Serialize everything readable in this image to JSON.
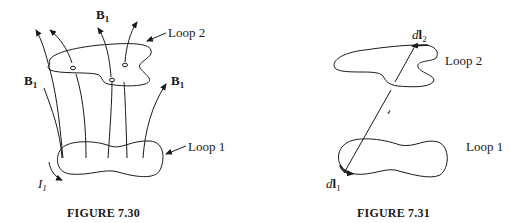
{
  "figures": [
    {
      "id": "fig-7-30",
      "caption": "FIGURE 7.30",
      "labels": {
        "b_top": {
          "main": "B",
          "sub": "1"
        },
        "b_left": {
          "main": "B",
          "sub": "1"
        },
        "b_right": {
          "main": "B",
          "sub": "1"
        },
        "loop2": "Loop 2",
        "loop1": "Loop 1",
        "current": {
          "main": "I",
          "sub": "1"
        }
      }
    },
    {
      "id": "fig-7-31",
      "caption": "FIGURE 7.31",
      "labels": {
        "dl2": {
          "d": "d",
          "main": "l",
          "sub": "2"
        },
        "dl1": {
          "d": "d",
          "main": "l",
          "sub": "1"
        },
        "loop2": "Loop 2",
        "loop1": "Loop 1",
        "separation": "𝓇"
      }
    }
  ],
  "colors": {
    "ink": "#1a1a1a",
    "background": "#ffffff"
  }
}
